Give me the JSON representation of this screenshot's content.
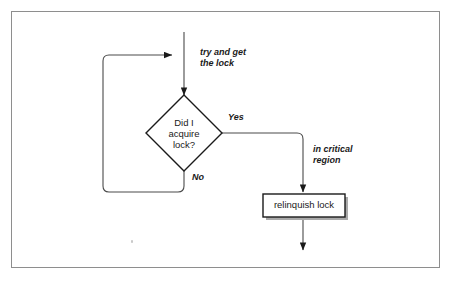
{
  "figure": {
    "domain": "diagram",
    "kind": "flowchart",
    "frame": {
      "border_color": "#8e8e8e",
      "background": "#ffffff",
      "x": 11,
      "y": 11,
      "width": 429,
      "height": 257
    }
  },
  "style": {
    "line_color": "#4a4a4a",
    "shape_stroke": "#1a1a1a",
    "shape_fill": "#ffffff",
    "shadow_color": "#aaaaaa",
    "text_color": "#1a1a1a"
  },
  "nodes": [
    {
      "id": "decision",
      "type": "decision",
      "shape": "diamond",
      "label": "Did I\nacquire\nlock?",
      "label_lines": [
        "Did I",
        "acquire",
        "lock?"
      ],
      "italic": false,
      "center": {
        "x": 184,
        "y": 133
      },
      "half_width": 38,
      "half_height": 38
    },
    {
      "id": "relinquish",
      "type": "process",
      "shape": "rectangle",
      "label": "relinquish lock",
      "italic": false,
      "box": {
        "x": 263,
        "y": 194,
        "width": 82,
        "height": 23
      },
      "has_shadow": true
    }
  ],
  "edge_labels": [
    {
      "id": "try-lock",
      "text": "try and get\nthe lock",
      "lines": [
        "try and get",
        "the lock"
      ],
      "italic": true,
      "position": {
        "x": 200,
        "y": 47
      }
    },
    {
      "id": "yes",
      "text": "Yes",
      "lines": [
        "Yes"
      ],
      "italic": true,
      "position": {
        "x": 228,
        "y": 112
      }
    },
    {
      "id": "no",
      "text": "No",
      "lines": [
        "No"
      ],
      "italic": true,
      "position": {
        "x": 192,
        "y": 172
      }
    },
    {
      "id": "critical-region",
      "text": "in critical\nregion",
      "lines": [
        "in critical",
        "region"
      ],
      "italic": true,
      "position": {
        "x": 313,
        "y": 144
      }
    }
  ],
  "edges": [
    {
      "id": "entry-to-decision",
      "from": "entry",
      "to": "decision",
      "label_ref": "try-lock",
      "arrowhead": "down",
      "path": "M 184 32 L 184 95"
    },
    {
      "id": "retry-loop",
      "from": "decision",
      "to": "entry-line",
      "label_ref": "no",
      "arrowhead": "right",
      "path": "M 184 171 L 184 186 Q 184 192 178 192 L 109 192 Q 103 192 103 186 L 103 61 Q 103 55 109 55 L 172 55"
    },
    {
      "id": "yes-branch",
      "from": "decision",
      "to": "relinquish",
      "label_ref": "yes",
      "arrowhead": "down",
      "path": "M 222 133 L 297 133 Q 303 133 303 139 L 303 192"
    },
    {
      "id": "exit",
      "from": "relinquish",
      "to": "exit",
      "arrowhead": "down",
      "path": "M 303 217 L 303 250"
    }
  ],
  "semantics": {
    "description": "A thread tries to acquire a lock; if acquisition fails it loops back and retries; if it succeeds it enters the critical region and then relinquishes the lock.",
    "decision_outcomes": [
      "Yes",
      "No"
    ]
  }
}
